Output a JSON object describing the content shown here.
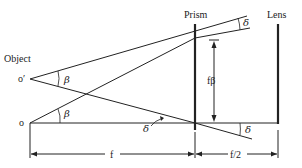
{
  "diagram": {
    "labels": {
      "object": "Object",
      "o_prime": "o′",
      "o": "o",
      "prism": "Prism",
      "lens": "Lens",
      "f_beta": "fβ",
      "f": "f",
      "f_half": "f/2"
    },
    "angles": {
      "beta_upper": "β",
      "beta_lower": "β",
      "delta_top": "δ",
      "delta_middle": "δ",
      "delta_bottom": "δ"
    },
    "colors": {
      "line": "#222222",
      "background": "#ffffff"
    }
  }
}
